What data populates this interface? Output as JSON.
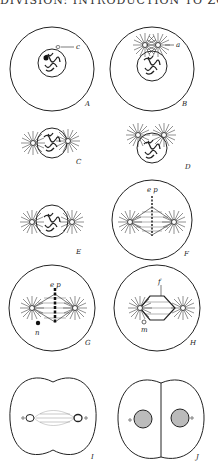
{
  "page": {
    "header_fragment": "DIVISION: INTRODUCTION TO ZOOLOGY"
  },
  "figures": [
    {
      "label": "A",
      "annotations": [
        "c"
      ]
    },
    {
      "label": "B",
      "annotations": [
        "a"
      ]
    },
    {
      "label": "C",
      "annotations": []
    },
    {
      "label": "D",
      "annotations": []
    },
    {
      "label": "E",
      "annotations": []
    },
    {
      "label": "F",
      "annotations": [
        "e p"
      ]
    },
    {
      "label": "G",
      "annotations": [
        "e p",
        "n"
      ]
    },
    {
      "label": "H",
      "annotations": [
        "f",
        "m"
      ]
    },
    {
      "label": "I",
      "annotations": []
    },
    {
      "label": "J",
      "annotations": []
    }
  ],
  "colors": {
    "ink": "#1a1a1a",
    "paper": "#ffffff"
  }
}
